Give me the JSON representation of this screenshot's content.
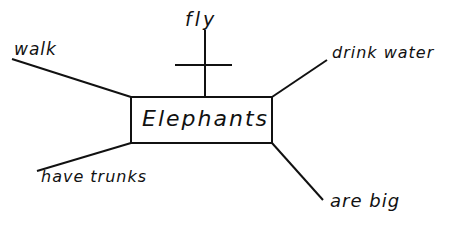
{
  "diagram": {
    "type": "sentence-diagram / mind-map",
    "center": {
      "label": "Elephants",
      "box": {
        "x": 131,
        "y": 97,
        "width": 141,
        "height": 46
      }
    },
    "branches": [
      {
        "id": "walk",
        "label": "walk",
        "position": "upper-left",
        "line": {
          "x1": 12,
          "y1": 59,
          "x2": 131,
          "y2": 97
        },
        "negated": false
      },
      {
        "id": "fly",
        "label": "fly",
        "position": "top",
        "line": {
          "x1": 205,
          "y1": 30,
          "x2": 205,
          "y2": 97
        },
        "negated": true,
        "crossbar": {
          "x1": 175,
          "y1": 65,
          "x2": 232,
          "y2": 65
        }
      },
      {
        "id": "drink-water",
        "label": "drink water",
        "position": "upper-right",
        "line": {
          "x1": 272,
          "y1": 97,
          "x2": 327,
          "y2": 60
        },
        "negated": false
      },
      {
        "id": "have-trunks",
        "label": "have trunks",
        "position": "lower-left",
        "line": {
          "x1": 131,
          "y1": 143,
          "x2": 37,
          "y2": 171
        },
        "negated": false
      },
      {
        "id": "are-big",
        "label": "are big",
        "position": "lower-right",
        "line": {
          "x1": 272,
          "y1": 143,
          "x2": 323,
          "y2": 200
        },
        "negated": false
      }
    ],
    "colors": {
      "ink": "#111111",
      "background": "#ffffff"
    }
  }
}
